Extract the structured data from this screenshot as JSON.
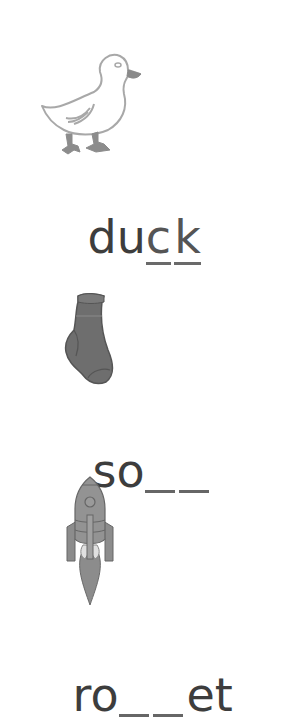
{
  "worksheet": {
    "items": [
      {
        "picture": "duck-icon",
        "word_prefix": "du",
        "answer_letters": [
          "c",
          "k"
        ],
        "word_suffix": "",
        "answer_shown": true
      },
      {
        "picture": "sock-icon",
        "word_prefix": "so",
        "blanks": 2,
        "word_suffix": "",
        "answer_shown": false
      },
      {
        "picture": "rocket-icon",
        "word_prefix": "ro",
        "blanks": 2,
        "word_suffix": "et",
        "answer_shown": false
      }
    ]
  }
}
